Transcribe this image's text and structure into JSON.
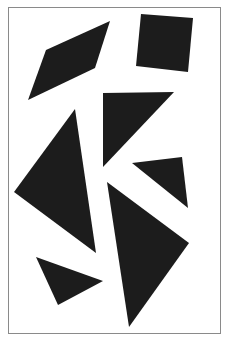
{
  "figure": {
    "width": 232,
    "height": 344,
    "background": "#ffffff",
    "frame": {
      "x": 8,
      "y": 7,
      "width": 213,
      "height": 327,
      "stroke": "#8a8a8a"
    },
    "fill_color": "#1c1c1c",
    "shapes": [
      {
        "name": "parallelogram",
        "points": "110,21 46,50 28,100 95,68"
      },
      {
        "name": "square",
        "points": "141,14 193,18 188,72 136,66"
      },
      {
        "name": "upper-middle-triangle",
        "points": "103,93 174,92 103,167"
      },
      {
        "name": "large-left-triangle",
        "points": "75,109 14,192 96,253"
      },
      {
        "name": "small-right-triangle",
        "points": "132,163 182,157 188,208"
      },
      {
        "name": "large-lower-right-triangle",
        "points": "107,182 189,243 129,327"
      },
      {
        "name": "bottom-left-triangle",
        "points": "36,257 103,281 58,305"
      }
    ]
  }
}
